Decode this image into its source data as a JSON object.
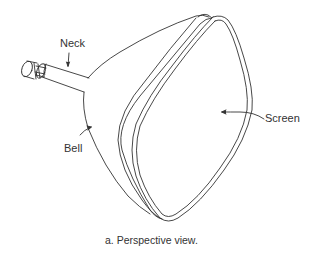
{
  "figure": {
    "caption": "a.  Perspective view.",
    "line_color": "#333333",
    "background": "#ffffff"
  },
  "labels": {
    "neck": "Neck",
    "bell": "Bell",
    "screen": "Screen"
  },
  "parts": [
    {
      "id": "neck",
      "label": "Neck"
    },
    {
      "id": "bell",
      "label": "Bell"
    },
    {
      "id": "screen",
      "label": "Screen"
    }
  ]
}
